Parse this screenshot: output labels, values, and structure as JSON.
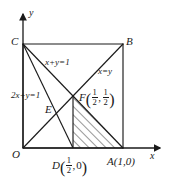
{
  "figure": {
    "type": "geometry-diagram",
    "axes": {
      "x_label": "x",
      "y_label": "y",
      "origin_label": "O"
    },
    "points": [
      {
        "id": "O",
        "label": "O",
        "x": 0,
        "y": 0
      },
      {
        "id": "A",
        "label": "A(1,0)",
        "x": 1,
        "y": 0
      },
      {
        "id": "B",
        "label": "B",
        "x": 1,
        "y": 1
      },
      {
        "id": "C",
        "label": "C",
        "x": 0,
        "y": 1
      },
      {
        "id": "D",
        "label_prefix": "D",
        "x": 0.5,
        "y": 0,
        "coord_num1": "1",
        "coord_den1": "2",
        "coord_second": "0"
      },
      {
        "id": "E",
        "label": "E",
        "x": 0.3333,
        "y": 0.3333
      },
      {
        "id": "F",
        "label_prefix": "F",
        "x": 0.5,
        "y": 0.5,
        "coord_num1": "1",
        "coord_den1": "2",
        "coord_num2": "1",
        "coord_den2": "2"
      }
    ],
    "line_labels": [
      {
        "id": "line-xplusy",
        "text": "x+y=1"
      },
      {
        "id": "line-xequalsy",
        "text": "x=y"
      },
      {
        "id": "line-2xplusy",
        "text": "2x+y=1"
      }
    ],
    "shaded_region": {
      "name": "hatched-triangle",
      "vertices": "F(1/2,1/2), D(1/2,0), A(1,0)",
      "fill": "hatch"
    },
    "colors": {
      "stroke": "#1a1a1a",
      "background": "#ffffff"
    }
  }
}
